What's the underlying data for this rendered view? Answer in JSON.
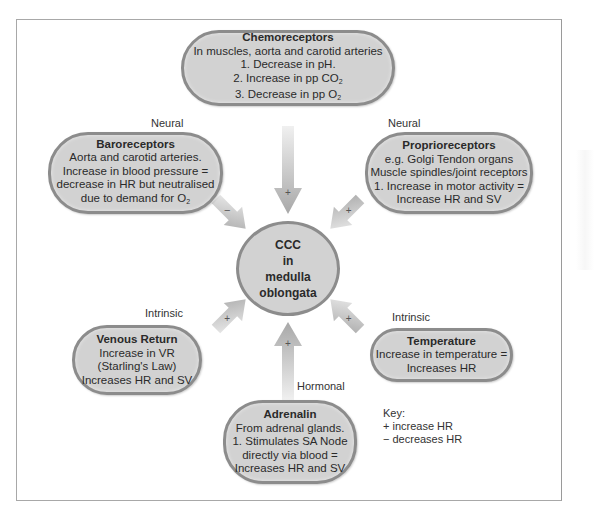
{
  "diagram": {
    "center": {
      "lines": [
        "CCC",
        "in",
        "medulla",
        "oblongata"
      ]
    },
    "nodes": {
      "chemoreceptors": {
        "title": "Chemoreceptors",
        "lines": [
          "In muscles, aorta and carotid arteries",
          "1. Decrease in pH.",
          "2. Increase in pp CO",
          "3. Decrease in pp O"
        ],
        "subscripts": [
          "2",
          "2"
        ],
        "arrow_sign": "+"
      },
      "baroreceptors": {
        "category": "Neural",
        "title": "Baroreceptors",
        "lines": [
          "Aorta and carotid arteries.",
          "Increase in blood pressure =",
          "decrease in HR but neutralised",
          "due to demand for O"
        ],
        "subscript": "2",
        "arrow_sign": "−"
      },
      "proprioreceptors": {
        "category": "Neural",
        "title": "Proprioreceptors",
        "lines": [
          "e.g. Golgi Tendon organs",
          "Muscle spindles/joint receptors",
          "1. Increase in motor activity =",
          "Increase HR and SV"
        ],
        "arrow_sign": "+"
      },
      "venous_return": {
        "category": "Intrinsic",
        "title": "Venous Return",
        "lines": [
          "Increase in VR",
          "(Starling's Law)",
          "Increases HR and SV"
        ],
        "arrow_sign": "+"
      },
      "temperature": {
        "category": "Intrinsic",
        "title": "Temperature",
        "lines": [
          "Increase in temperature =",
          "Increases HR"
        ],
        "arrow_sign": "+"
      },
      "adrenalin": {
        "category": "Hormonal",
        "title": "Adrenalin",
        "lines": [
          "From adrenal glands.",
          "1. Stimulates SA Node",
          "directly via blood =",
          "Increases HR and SV"
        ],
        "arrow_sign": "+"
      }
    },
    "key": {
      "title": "Key:",
      "items": [
        "+ increase HR",
        "− decreases HR"
      ]
    },
    "colors": {
      "box_fill": "#d2d2d2",
      "box_border": "#8c8c8c",
      "arrow": "#b8b8b8",
      "frame": "#a8a8a8"
    }
  }
}
